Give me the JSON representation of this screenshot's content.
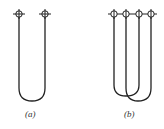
{
  "figure": {
    "panels": [
      {
        "id": "a",
        "label": "(a)",
        "description": "Single U-shaped wire loop with two terminals"
      },
      {
        "id": "b",
        "label": "(b)",
        "description": "Two interleaved U-shaped wire loops with four terminals"
      }
    ],
    "colors": {
      "line": "#222222",
      "background": "#ffffff"
    }
  }
}
